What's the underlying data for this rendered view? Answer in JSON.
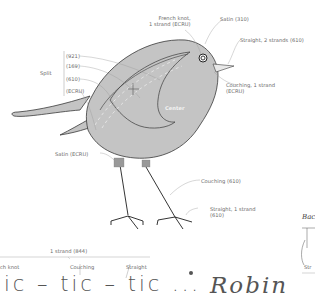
{
  "diagram": {
    "colors": {
      "body_fill": "#c4c4c4",
      "outline": "#3a3a3a",
      "leader_line": "#9a9a9a",
      "label_text": "#6b6b6b",
      "leg": "#1e1e1e"
    },
    "labels": {
      "french_knot": "French knot,\n1 strand (ECRU)",
      "french_knot_l1": "French knot,",
      "french_knot_l2": "1 strand (ECRU)",
      "satin_310": "Satin (310)",
      "straight_2": "Straight, 2 strands (610)",
      "split_label": "Split",
      "split_items": [
        "(921)",
        "(169)",
        "(610)",
        "(ECRU)"
      ],
      "couching_ecru_l1": "Couching, 1 strand",
      "couching_ecru_l2": "(ECRU)",
      "center": "Center",
      "satin_ecru": "Satin (ECRU)",
      "couching_610": "Couching (610)",
      "straight_1_l1": "Straight, 1 strand",
      "straight_1_l2": "(610)"
    },
    "lettering": {
      "strand_label": "1 strand (844)",
      "stitch_labels": [
        "ch knot",
        "Couching",
        "Straight"
      ],
      "text": "ic – tic – tic ...",
      "word": "Robin"
    },
    "side_panel": {
      "title_fragment": "Bac",
      "label_fragment": "Str"
    }
  }
}
